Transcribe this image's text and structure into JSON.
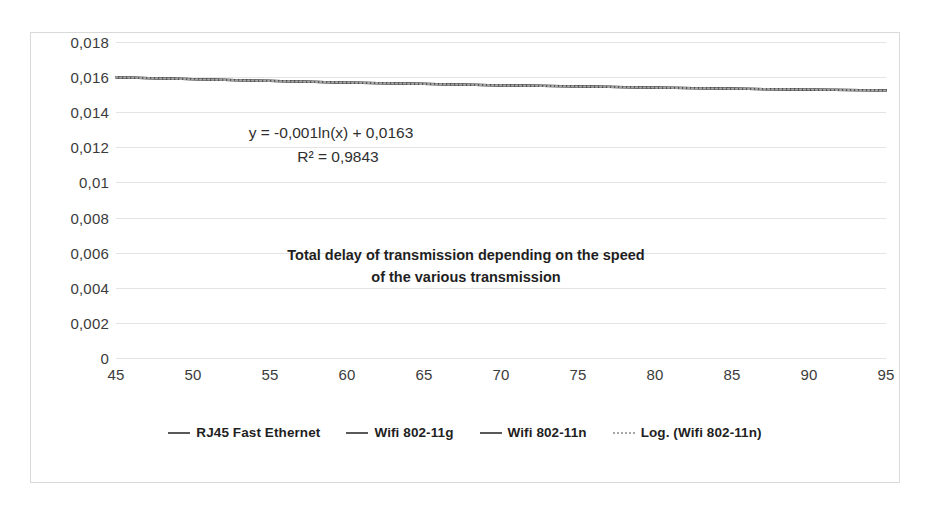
{
  "chart_data": {
    "type": "line",
    "title": "Total delay of transmission depending on the speed of the various transmission",
    "title_lines": [
      "Total delay of transmission depending on the speed",
      "of the various transmission"
    ],
    "xlabel": "",
    "ylabel": "",
    "xlim": [
      45,
      95
    ],
    "ylim": [
      0,
      0.018
    ],
    "grid": true,
    "legend_position": "bottom",
    "decimal_separator": ",",
    "x_ticks": [
      45,
      50,
      55,
      60,
      65,
      70,
      75,
      80,
      85,
      90,
      95
    ],
    "x_tick_labels": [
      "45",
      "50",
      "55",
      "60",
      "65",
      "70",
      "75",
      "80",
      "85",
      "90",
      "95"
    ],
    "y_ticks": [
      0,
      0.002,
      0.004,
      0.006,
      0.008,
      0.01,
      0.012,
      0.014,
      0.016,
      0.018
    ],
    "y_tick_labels": [
      "0",
      "0,002",
      "0,004",
      "0,006",
      "0,008",
      "0,01",
      "0,012",
      "0,014",
      "0,016",
      "0,018"
    ],
    "x": [
      45,
      50,
      55,
      60,
      65,
      70,
      75,
      80,
      85,
      90,
      95
    ],
    "series": [
      {
        "name": "RJ45 Fast Ethernet",
        "style": "solid",
        "color": "#595959",
        "values": [
          0.01599,
          0.01588,
          0.01578,
          0.01569,
          0.01561,
          0.01553,
          0.01547,
          0.0154,
          0.01534,
          0.01529,
          0.01524
        ]
      },
      {
        "name": "Wifi 802-11g",
        "style": "solid",
        "color": "#595959",
        "values": [
          0.01599,
          0.01588,
          0.01578,
          0.01569,
          0.01561,
          0.01553,
          0.01547,
          0.0154,
          0.01534,
          0.01529,
          0.01524
        ]
      },
      {
        "name": "Wifi 802-11n",
        "style": "solid",
        "color": "#404040",
        "values": [
          0.01599,
          0.01588,
          0.01578,
          0.01569,
          0.01561,
          0.01553,
          0.01547,
          0.0154,
          0.01534,
          0.01529,
          0.01524
        ]
      },
      {
        "name": "Log. (Wifi 802-11n)",
        "style": "dotted",
        "color": "#a6a6a6",
        "trendline": true,
        "equation": "y = -0,001ln(x) + 0,0163",
        "r_squared": 0.9843,
        "values": [
          0.01599,
          0.01588,
          0.01578,
          0.01569,
          0.01561,
          0.01553,
          0.01547,
          0.0154,
          0.01534,
          0.01529,
          0.01524
        ]
      }
    ],
    "annotations": [
      {
        "name": "trendline-equation",
        "text": "y = -0,001ln(x) + 0,0163"
      },
      {
        "name": "trendline-r2",
        "text": "R² = 0,9843"
      }
    ],
    "legend": [
      {
        "label": "RJ45 Fast Ethernet",
        "style": "solid"
      },
      {
        "label": "Wifi 802-11g",
        "style": "solid"
      },
      {
        "label": "Wifi 802-11n",
        "style": "solid"
      },
      {
        "label": "Log. (Wifi 802-11n)",
        "style": "dotted"
      }
    ],
    "colors": {
      "series_line": "#595959",
      "trendline": "#a6a6a6",
      "gridline": "#e4e4e4",
      "border": "#d9d9d9",
      "text": "#1f1f1f",
      "tick_text": "#3b3b3b",
      "background": "#ffffff"
    }
  }
}
